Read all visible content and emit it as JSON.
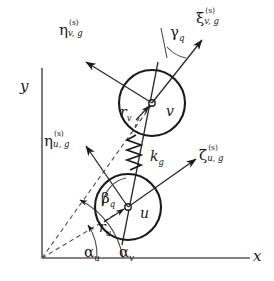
{
  "figure": {
    "background_color": "#ffffff",
    "line_color": "#1a1a1a",
    "width": 274,
    "height": 281
  },
  "axes": {
    "x_label": "x",
    "y_label": "y",
    "origin_label": ""
  },
  "gears": [
    {
      "id": "v",
      "center_label": "v",
      "radius_label": "r",
      "radius_subscript": "v",
      "cx": 152,
      "cy": 103,
      "r": 33
    },
    {
      "id": "u",
      "center_label": "u",
      "radius_label": "r",
      "radius_subscript": "u",
      "cx": 128,
      "cy": 207,
      "r": 33
    }
  ],
  "spring": {
    "label_base": "k",
    "label_subscript": "g"
  },
  "coordinate_axes": [
    {
      "id": "eta-v",
      "base": "η",
      "superscript": "(s)",
      "subscript": "v, g"
    },
    {
      "id": "xi-v",
      "base": "ξ",
      "superscript": "(s)",
      "subscript": "v, g"
    },
    {
      "id": "eta-u",
      "base": "η",
      "superscript": "(s)",
      "subscript": "u, g"
    },
    {
      "id": "zeta-u",
      "base": "ζ",
      "superscript": "(s)",
      "subscript": "u, g"
    }
  ],
  "angles": [
    {
      "id": "gamma-q",
      "base": "γ",
      "subscript": "q"
    },
    {
      "id": "beta-q",
      "base": "β",
      "subscript": "q"
    },
    {
      "id": "alpha-u",
      "base": "α",
      "subscript": "u"
    },
    {
      "id": "alpha-v",
      "base": "α",
      "subscript": "v"
    }
  ]
}
